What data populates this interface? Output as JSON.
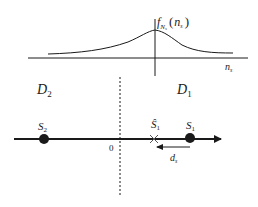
{
  "diagram": {
    "pdf_panel": {
      "function_label": "f",
      "function_subscript": "N",
      "function_subsubscript": "s",
      "function_arg_open": "(",
      "function_arg": "n",
      "function_arg_subscript": "s",
      "function_arg_close": ")",
      "x_axis_label": "n",
      "x_axis_label_subscript": "s"
    },
    "regions": {
      "left_label": "D",
      "left_subscript": "2",
      "right_label": "D",
      "right_subscript": "1"
    },
    "number_line": {
      "origin_label": "0",
      "points": [
        {
          "name": "S",
          "subscript": "2",
          "marker": "dot"
        },
        {
          "name": "S",
          "subscript": "1",
          "marker": "dot"
        },
        {
          "name": "Ŝ",
          "subscript": "1",
          "marker": "cross"
        }
      ],
      "displacement_label": "d",
      "displacement_subscript": "s"
    },
    "colors": {
      "stroke": "#1a1a1a",
      "background": "#ffffff"
    }
  }
}
